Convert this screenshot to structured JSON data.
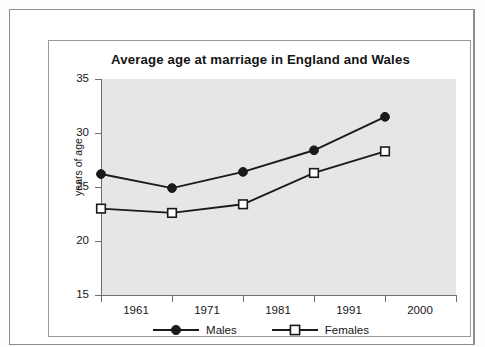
{
  "chart_data": {
    "type": "line",
    "title": "Average age at marriage in England and Wales",
    "xlabel": "",
    "ylabel": "years of age",
    "categories": [
      "1961",
      "1971",
      "1981",
      "1991",
      "2000"
    ],
    "series": [
      {
        "name": "Males",
        "values": [
          26.2,
          24.9,
          26.4,
          28.4,
          31.5
        ],
        "marker": "filled-circle",
        "color": "#1a1a1a"
      },
      {
        "name": "Females",
        "values": [
          23.0,
          22.6,
          23.4,
          26.3,
          28.3
        ],
        "marker": "open-square",
        "color": "#1a1a1a"
      }
    ],
    "ylim": [
      15,
      35
    ],
    "y_ticks": [
      15,
      20,
      25,
      30,
      35
    ],
    "grid": false,
    "legend_position": "bottom",
    "plot_background": "#e6e6e6",
    "axis_color": "#6e6e6e"
  },
  "chart": {
    "title": "Average age at marriage in England and Wales",
    "y_axis_title": "years of age",
    "y_ticks": [
      "35",
      "30",
      "25",
      "20",
      "15"
    ],
    "x_ticks": [
      "1961",
      "1971",
      "1981",
      "1991",
      "2000"
    ],
    "legend": [
      {
        "label": "Males"
      },
      {
        "label": "Females"
      }
    ]
  }
}
